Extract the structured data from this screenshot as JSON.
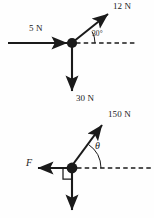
{
  "figure": {
    "background_color": "#fefefe",
    "stroke_color": "#1a1a1a",
    "diagrams": [
      {
        "name": "upper-force-diagram",
        "origin": {
          "x": 72,
          "y": 43
        },
        "reference_line": "horizontal dashed to the right of origin",
        "vectors": [
          {
            "label": "12 N",
            "magnitude": 12,
            "unit": "N",
            "direction_deg": 30,
            "description": "up and to the right at 30 degrees above horizontal"
          },
          {
            "label": "5 N",
            "magnitude": 5,
            "unit": "N",
            "direction_deg": 0,
            "description": "horizontal pointing right into the node"
          },
          {
            "label": "30 N",
            "magnitude": 30,
            "unit": "N",
            "direction_deg": 270,
            "description": "vertically downward"
          }
        ],
        "angles": [
          {
            "label": "30°",
            "value": 30,
            "unit": "deg",
            "between": [
              "horizontal dashed reference",
              "12 N vector"
            ]
          }
        ]
      },
      {
        "name": "lower-force-diagram",
        "origin": {
          "x": 72,
          "y": 168
        },
        "reference_line": "horizontal dashed to the right of origin",
        "vectors": [
          {
            "label": "150 N",
            "magnitude": 150,
            "unit": "N",
            "direction_deg": 55,
            "description": "up and to the right at angle theta above horizontal"
          },
          {
            "label": "F",
            "magnitude": null,
            "unit": "N",
            "direction_deg": 180,
            "description": "horizontal pointing left, unknown magnitude"
          },
          {
            "label": "",
            "magnitude": null,
            "unit": "N",
            "direction_deg": 270,
            "description": "vertically downward, label cropped off bottom of image"
          }
        ],
        "angles": [
          {
            "label": "θ",
            "value": null,
            "unit": "deg",
            "between": [
              "horizontal dashed reference",
              "150 N vector"
            ]
          }
        ],
        "markers": [
          {
            "type": "right-angle-square",
            "description": "square marking the 90 degree angle between the leftward F vector and the downward vector"
          }
        ]
      }
    ],
    "labels": {
      "force_12n": "12 N",
      "force_5n": "5 N",
      "angle_30": "30°",
      "force_30n": "30 N",
      "force_150n": "150 N",
      "angle_theta": "θ",
      "force_f": "F"
    }
  }
}
